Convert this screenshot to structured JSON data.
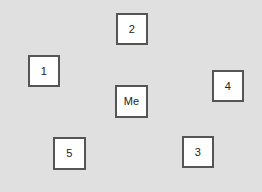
{
  "canvas": {
    "width": 262,
    "height": 192,
    "background_color": "#e0e0e0"
  },
  "style": {
    "node_fill": "#ffffff",
    "node_border_color": "#555555",
    "node_border_width": 2,
    "node_text_color": "#222222"
  },
  "nodes": [
    {
      "label": "2",
      "x": 116,
      "y": 13,
      "w": 32,
      "h": 32
    },
    {
      "label": "1",
      "x": 28,
      "y": 55,
      "w": 32,
      "h": 32
    },
    {
      "label": "4",
      "x": 212,
      "y": 70,
      "w": 32,
      "h": 32
    },
    {
      "label": "Me",
      "x": 115,
      "y": 85,
      "w": 33,
      "h": 33
    },
    {
      "label": "3",
      "x": 182,
      "y": 136,
      "w": 32,
      "h": 32
    },
    {
      "label": "5",
      "x": 53,
      "y": 137,
      "w": 33,
      "h": 33
    }
  ]
}
